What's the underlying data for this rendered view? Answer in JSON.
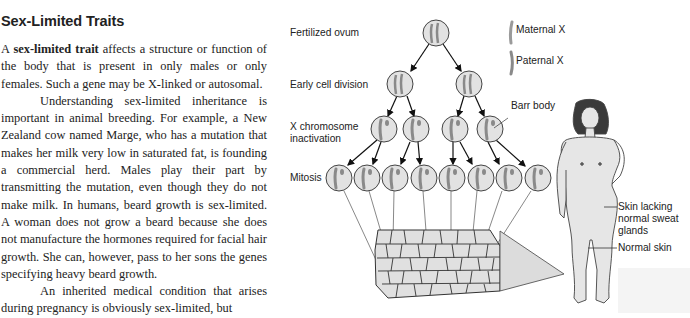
{
  "section": {
    "heading": "Sex-Limited Traits",
    "paragraphs": [
      {
        "term": "sex-limited trait",
        "lead": "A ",
        "text": " affects a structure or func­tion of the body that is present in only males or only females. Such a gene may be X-linked or autosomal."
      },
      {
        "text": "Understanding sex-limited inheritance is important in animal breeding. For example, a New Zealand cow named Marge, who has a mutation that makes her milk very low in saturated fat, is found­ing a commercial herd. Males play their part by transmitting the mutation, even though they do not make milk. In humans, beard growth is sex-limited. A woman does not grow a beard because she does not manufacture the hormones required for facial hair growth. She can, however, pass to her sons the genes specifying heavy beard growth."
      },
      {
        "text": "An inherited medical condition that arises during pregnancy is obviously sex-limited, but"
      }
    ]
  },
  "figure": {
    "stage_labels": {
      "fertilized_ovum": "Fertilized ovum",
      "early_cell_division": "Early cell division",
      "x_inactivation_line1": "X chromosome",
      "x_inactivation_line2": "inactivation",
      "mitosis": "Mitosis"
    },
    "legend": {
      "maternal": "Maternal X",
      "paternal": "Paternal X"
    },
    "callouts": {
      "barr_body": "Barr body",
      "skin_lacking_line1": "Skin lacking",
      "skin_lacking_line2": "normal sweat",
      "skin_lacking_line3": "glands",
      "normal_skin": "Normal skin"
    },
    "colors": {
      "cell_fill": "#e2e2e2",
      "outline": "#333333",
      "chromosome": "#9a9a9a",
      "skin": "#e6e6e6",
      "hair": "#3a3a3a"
    }
  }
}
